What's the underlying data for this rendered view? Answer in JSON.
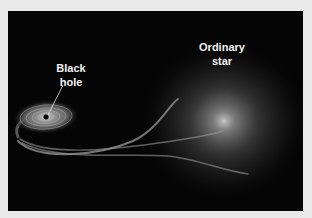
{
  "figure": {
    "labels": {
      "black_hole_line1": "Black",
      "black_hole_line2": "hole",
      "star_line1": "Ordinary",
      "star_line2": "star"
    },
    "colors": {
      "frame": "#e9e9e9",
      "background": "#050505",
      "label": "#f2f2f2"
    }
  }
}
